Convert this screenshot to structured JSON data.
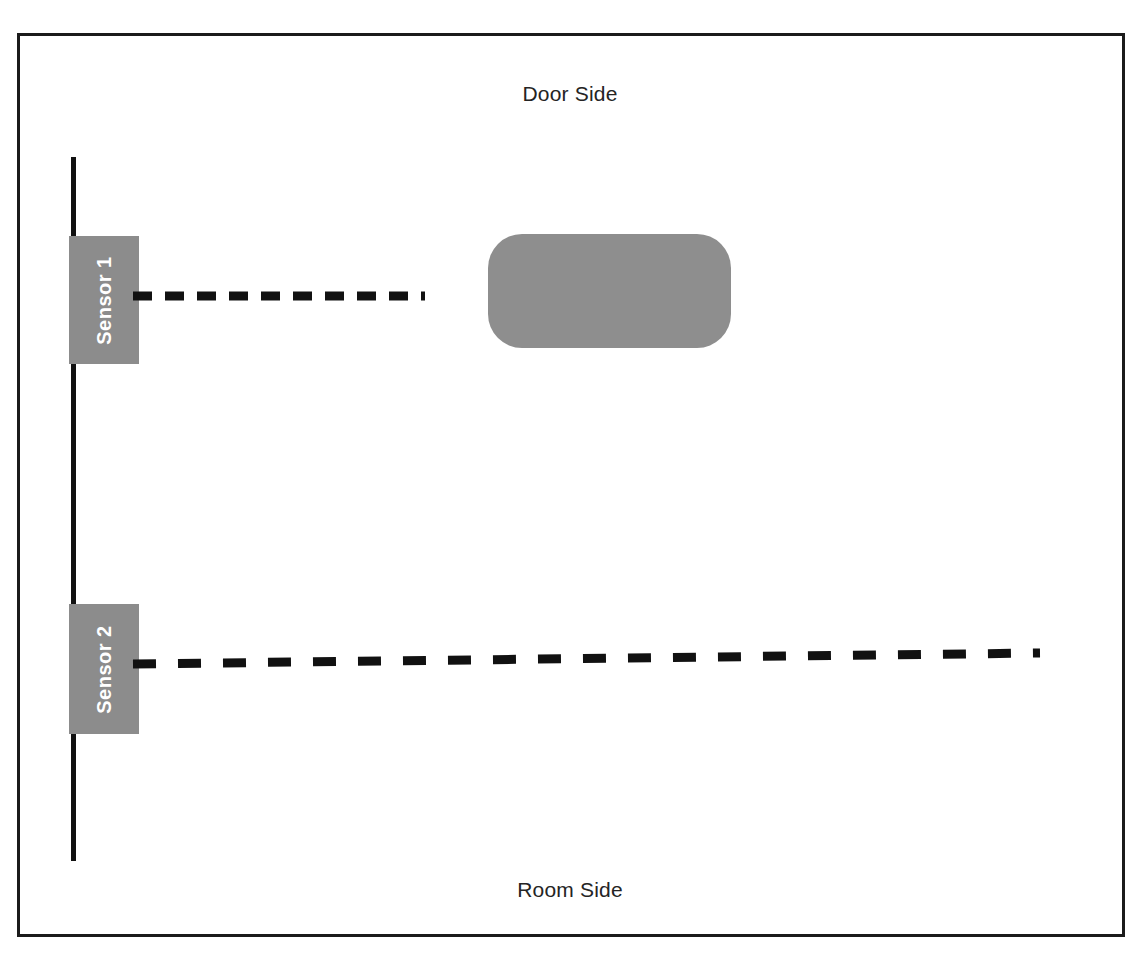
{
  "diagram": {
    "title_top": "Door Side",
    "title_bottom": "Room Side",
    "frame": {
      "x": 17,
      "y": 33,
      "width": 1108,
      "height": 904,
      "border_color": "#1b1b1b",
      "border_width": 3,
      "background": "#ffffff"
    },
    "wall": {
      "name": "door-wall-line",
      "x": 71,
      "y_top": 157,
      "y_bottom": 861,
      "thickness": 5,
      "color": "#111111"
    },
    "sensors": [
      {
        "id": "sensor-1",
        "label": "Sensor 1",
        "box": {
          "x": 69,
          "y": 236,
          "width": 70,
          "height": 128
        },
        "box_color": "#8c8c8c",
        "label_color": "#ffffff",
        "label_rotation_deg": -90,
        "beam": {
          "name": "sensor-1-beam",
          "x1": 133,
          "y1": 296,
          "x2": 425,
          "y2": 296,
          "color": "#111111",
          "thickness": 9,
          "dash": "18 13",
          "blocked": true,
          "note": "beam terminates before the obstacle"
        }
      },
      {
        "id": "sensor-2",
        "label": "Sensor 2",
        "box": {
          "x": 69,
          "y": 604,
          "width": 70,
          "height": 130
        },
        "box_color": "#8c8c8c",
        "label_color": "#ffffff",
        "label_rotation_deg": -90,
        "beam": {
          "name": "sensor-2-beam",
          "x1": 133,
          "y1": 664,
          "x2": 1040,
          "y2": 653,
          "color": "#111111",
          "thickness": 9,
          "dash": "22 22",
          "blocked": false,
          "note": "beam crosses the full room width"
        }
      }
    ],
    "obstacle": {
      "name": "obstacle-object",
      "x": 488,
      "y": 234,
      "width": 243,
      "height": 114,
      "corner_radius": 34,
      "fill": "#8e8e8e",
      "label": ""
    },
    "colors": {
      "gray_fill": "#8c8c8c",
      "line_black": "#111111",
      "frame_black": "#1b1b1b",
      "text_dark": "#242424",
      "white": "#ffffff"
    }
  }
}
